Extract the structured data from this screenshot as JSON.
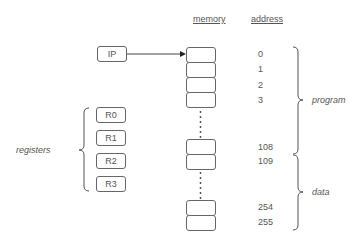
{
  "headers": {
    "memory": "memory",
    "address": "address"
  },
  "ip": {
    "label": "IP",
    "points_to_address": "0"
  },
  "registers": {
    "group_label": "registers",
    "items": [
      {
        "label": "R0"
      },
      {
        "label": "R1"
      },
      {
        "label": "R2"
      },
      {
        "label": "R3"
      }
    ]
  },
  "memory": {
    "cells": [
      {
        "address": "0"
      },
      {
        "address": "1"
      },
      {
        "address": "2"
      },
      {
        "address": "3"
      },
      {
        "address": "108"
      },
      {
        "address": "109"
      },
      {
        "address": "254"
      },
      {
        "address": "255"
      }
    ]
  },
  "regions": [
    {
      "label": "program",
      "from": "0",
      "to": "108"
    },
    {
      "label": "data",
      "from": "109",
      "to": "255"
    }
  ]
}
